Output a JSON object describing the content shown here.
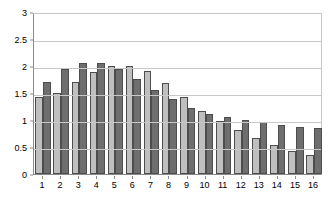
{
  "chart_data": {
    "type": "bar",
    "title": "",
    "subtitle": "",
    "xlabel": "",
    "ylabel": "",
    "categories": [
      "1",
      "2",
      "3",
      "4",
      "5",
      "6",
      "7",
      "8",
      "9",
      "10",
      "11",
      "12",
      "13",
      "14",
      "15",
      "16"
    ],
    "series": [
      {
        "name": "Series 1",
        "color": "#bfbfbf",
        "values": [
          1.42,
          1.5,
          1.7,
          1.88,
          2.0,
          2.0,
          1.9,
          1.68,
          1.42,
          1.16,
          0.98,
          0.81,
          0.66,
          0.53,
          0.43,
          0.35
        ]
      },
      {
        "name": "Series 2",
        "color": "#6e6e6e",
        "values": [
          1.71,
          1.94,
          2.05,
          2.05,
          1.94,
          1.76,
          1.56,
          1.38,
          1.23,
          1.12,
          1.05,
          1.0,
          0.96,
          0.9,
          0.87,
          0.85
        ]
      }
    ],
    "ylim": [
      0,
      3
    ],
    "yticks": [
      0,
      0.5,
      1,
      1.5,
      2,
      2.5,
      3
    ],
    "ytick_labels": [
      "0",
      "0.5",
      "1",
      "1.5",
      "2",
      "2.5",
      "3"
    ],
    "grid": true,
    "grid_axis": "y",
    "legend": false,
    "legend_position": "none",
    "bar_border_color": "#4d4d4d",
    "plot_background": "#ffffff"
  }
}
